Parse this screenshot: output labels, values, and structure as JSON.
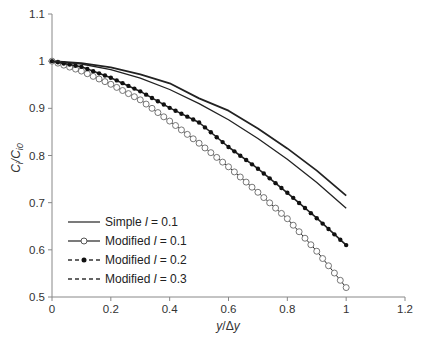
{
  "chart_data": {
    "type": "line",
    "title": "",
    "xlabel": "y/Δy",
    "ylabel": "Ci/Ci0",
    "xlim": [
      0,
      1.2
    ],
    "ylim": [
      0.5,
      1.1
    ],
    "x_ticks": [
      "0",
      "0.2",
      "0.4",
      "0.6",
      "0.8",
      "1",
      "1.2"
    ],
    "y_ticks": [
      "0.5",
      "0.6",
      "0.7",
      "0.8",
      "0.9",
      "1",
      "1.1"
    ],
    "grid": false,
    "legend_position": "lower-left inside",
    "x": [
      0,
      0.1,
      0.2,
      0.3,
      0.4,
      0.5,
      0.6,
      0.7,
      0.8,
      0.9,
      1.0
    ],
    "series": [
      {
        "name": "Simple l = 0.1",
        "style": "solid",
        "marker": "none",
        "values": [
          1.0,
          0.996,
          0.987,
          0.972,
          0.953,
          0.921,
          0.895,
          0.857,
          0.815,
          0.768,
          0.715
        ]
      },
      {
        "name": "Modified l = 0.1",
        "style": "solid",
        "marker": "open-circle",
        "values": [
          1.0,
          0.979,
          0.951,
          0.918,
          0.873,
          0.826,
          0.776,
          0.722,
          0.666,
          0.597,
          0.52
        ]
      },
      {
        "name": "Modified l = 0.2",
        "style": "dashed",
        "marker": "filled-circle",
        "values": [
          1.0,
          0.988,
          0.965,
          0.936,
          0.901,
          0.87,
          0.818,
          0.772,
          0.721,
          0.667,
          0.61
        ]
      },
      {
        "name": "Modified l = 0.3",
        "style": "dashed",
        "marker": "none",
        "values": [
          1.0,
          0.994,
          0.982,
          0.964,
          0.94,
          0.91,
          0.876,
          0.836,
          0.792,
          0.743,
          0.688
        ]
      }
    ]
  },
  "axes": {
    "xlabel_y": "y",
    "xlabel_sep": "/Δ",
    "xlabel_y2": "y",
    "ylabel_main": "C",
    "ylabel_sub1": "i",
    "ylabel_sep": "/C",
    "ylabel_sub2": "i0"
  },
  "legend": [
    {
      "prefix": "Simple ",
      "var": "l",
      "suffix": " = 0.1"
    },
    {
      "prefix": "Modified ",
      "var": "l",
      "suffix": " = 0.1"
    },
    {
      "prefix": "Modified ",
      "var": "l",
      "suffix": " = 0.2"
    },
    {
      "prefix": "Modified ",
      "var": "l",
      "suffix": " = 0.3"
    }
  ]
}
